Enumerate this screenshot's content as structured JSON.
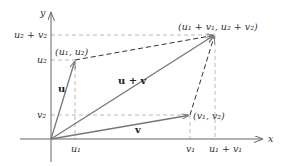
{
  "diagram": {
    "type": "vector-addition-parallelogram",
    "axes": {
      "x_label": "x",
      "y_label": "y"
    },
    "vectors": [
      {
        "name": "u",
        "label": "u",
        "tail": "origin",
        "head": "(u1, u2)"
      },
      {
        "name": "v",
        "label": "v",
        "tail": "origin",
        "head": "(v1, v2)"
      },
      {
        "name": "u+v",
        "label": "u + v",
        "tail": "origin",
        "head": "(u1 + v1, u2 + v2)"
      }
    ],
    "points": {
      "u_head": "(u₁, u₂)",
      "v_head": "(v₁, v₂)",
      "sum_head": "(u₁ + v₁, u₂ + v₂)"
    },
    "x_ticks": [
      "u₁",
      "v₁",
      "u₁ + v₁"
    ],
    "y_ticks": [
      "u₂ + v₂",
      "u₂",
      "v₂"
    ],
    "colors": {
      "axis": "#555555",
      "vector": "#777777",
      "parallelogram_dash": "#333333",
      "guide_dash": "#bbbbbb"
    }
  }
}
